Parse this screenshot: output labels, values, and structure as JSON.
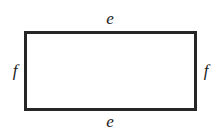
{
  "figure": {
    "name": "labeled-rectangle-diagram",
    "shape": "rectangle",
    "background_color": "#ffffff",
    "stroke_color": "#262626",
    "stroke_width_px": 3,
    "label_color": "#1c1c1c",
    "labels": {
      "top": "e",
      "bottom": "e",
      "left": "f",
      "right": "f"
    }
  }
}
